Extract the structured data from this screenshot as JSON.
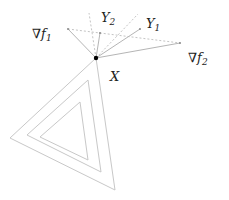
{
  "diagram": {
    "labels": {
      "grad_f1": "∇f",
      "grad_f1_sub": "1",
      "grad_f2": "∇f",
      "grad_f2_sub": "2",
      "y1": "Y",
      "y1_sub": "1",
      "y2": "Y",
      "y2_sub": "2",
      "x": "X"
    },
    "point_x": [
      96,
      58
    ],
    "vectors": {
      "grad_f1": [
        68,
        29
      ],
      "grad_f2": [
        180,
        43
      ],
      "y1": [
        140,
        29
      ],
      "y2": [
        100,
        33
      ]
    },
    "nested_triangles": 3,
    "colors": {
      "lines": "#b5b5b5",
      "dashed": "#c4c4c4",
      "point": "#000000",
      "text": "#222222"
    }
  }
}
